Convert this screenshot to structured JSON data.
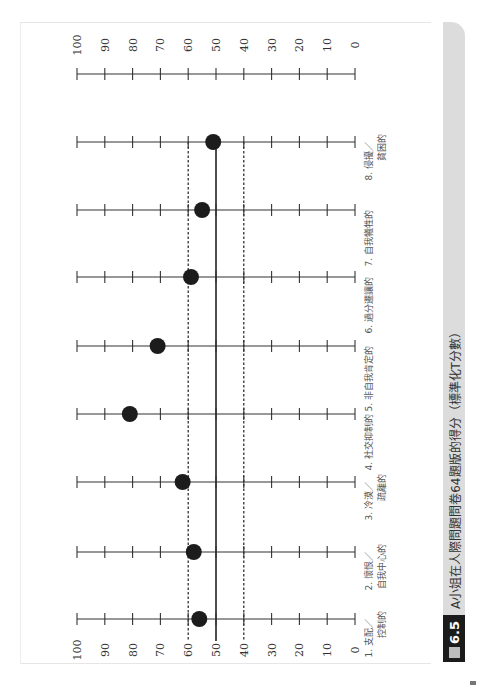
{
  "caption": {
    "figure_label": "6.5",
    "figure_prefix_icon": "figure-box-icon",
    "text": "A小姐在人際問題問卷64題版的得分（標準化T分數）"
  },
  "chart_data": {
    "type": "scatter",
    "orientation": "rotated-90-ccw",
    "title": "A小姐在人際問題問卷64題版的得分（標準化T分數）",
    "xlabel": "",
    "ylabel": "標準化T分數",
    "ylim": [
      0,
      100
    ],
    "ticks": [
      100,
      90,
      80,
      70,
      60,
      50,
      40,
      30,
      20,
      10,
      0
    ],
    "categories": [
      "1. 支配／控制的",
      "2. 懷恨／自我中心的",
      "3. 冷漠／疏離的",
      "4. 社交抑制的",
      "5. 非自我肯定的",
      "6. 過分遷讓的",
      "7. 自我犧牲的",
      "8. 侵擾／貧困的"
    ],
    "category_lines": [
      [
        "1. 支配／",
        "控制的"
      ],
      [
        "2. 懷恨／",
        "自我中心的"
      ],
      [
        "3. 冷漠／",
        "疏離的"
      ],
      [
        "4. 社交抑制的"
      ],
      [
        "5. 非自我肯定的"
      ],
      [
        "6. 過分遷讓的"
      ],
      [
        "7. 自我犧牲的"
      ],
      [
        "8. 侵擾／",
        "貧困的"
      ]
    ],
    "values": [
      56,
      58,
      62,
      81,
      71,
      59,
      55,
      51
    ],
    "reference_lines": [
      {
        "value": 60,
        "style": "dashed"
      },
      {
        "value": 50,
        "style": "solid"
      },
      {
        "value": 40,
        "style": "dashed"
      }
    ],
    "tick_label_rows": [
      "bottom",
      "top"
    ],
    "grid": false,
    "legend": null
  }
}
